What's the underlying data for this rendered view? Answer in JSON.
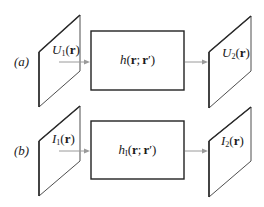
{
  "diagram": {
    "type": "imaging-system-block-diagram",
    "rows": [
      {
        "id": "a",
        "row_label": "(a)",
        "input_plane": {
          "symbol": "U",
          "subscript": "1",
          "arg": "(r)",
          "text": "U1(r)"
        },
        "system": {
          "symbol": "h",
          "subscript": "",
          "arg": "(r; r′)",
          "text": "h(r; r′)"
        },
        "output_plane": {
          "symbol": "U",
          "subscript": "2",
          "arg": "(r)",
          "text": "U2(r)"
        }
      },
      {
        "id": "b",
        "row_label": "(b)",
        "input_plane": {
          "symbol": "I",
          "subscript": "1",
          "arg": "(r)",
          "text": "I1(r)"
        },
        "system": {
          "symbol": "h",
          "subscript": "I",
          "arg": "(r; r′)",
          "text": "hI(r; r′)"
        },
        "output_plane": {
          "symbol": "I",
          "subscript": "2",
          "arg": "(r)",
          "text": "I2(r)"
        }
      }
    ],
    "colors": {
      "line": "#222222",
      "arrow": "#9a9a9a",
      "background": "#ffffff"
    }
  }
}
